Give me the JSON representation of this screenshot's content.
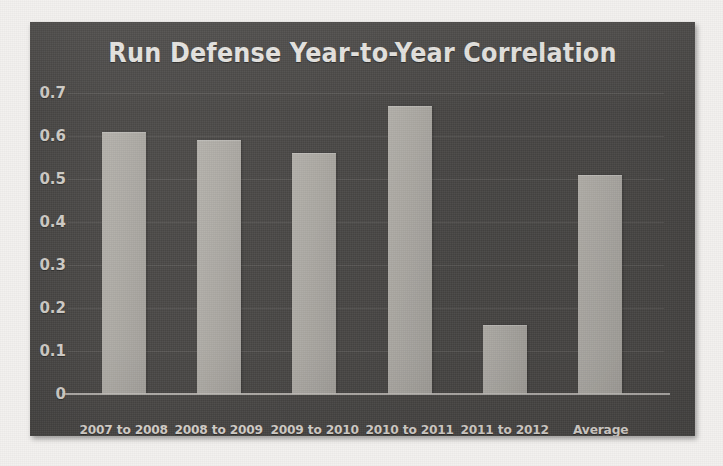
{
  "figure": {
    "background_color": "#4a4846",
    "bar_color": "#b2afa9",
    "text_color": "#e8e5e0"
  },
  "chart_data": {
    "type": "bar",
    "title": "Run Defense Year-to-Year Correlation",
    "xlabel": "",
    "ylabel": "",
    "categories": [
      "2007 to 2008",
      "2008 to 2009",
      "2009 to 2010",
      "2010 to 2011",
      "2011 to 2012",
      "Average"
    ],
    "values": [
      0.61,
      0.59,
      0.56,
      0.67,
      0.16,
      0.51
    ],
    "ylim": [
      0,
      0.7
    ],
    "ytick_labels": [
      "0",
      "0.1",
      "0.2",
      "0.3",
      "0.4",
      "0.5",
      "0.6",
      "0.7"
    ],
    "ytick_values": [
      0,
      0.1,
      0.2,
      0.3,
      0.4,
      0.5,
      0.6,
      0.7
    ],
    "grid": true,
    "legend": null,
    "legend_position": "none"
  }
}
